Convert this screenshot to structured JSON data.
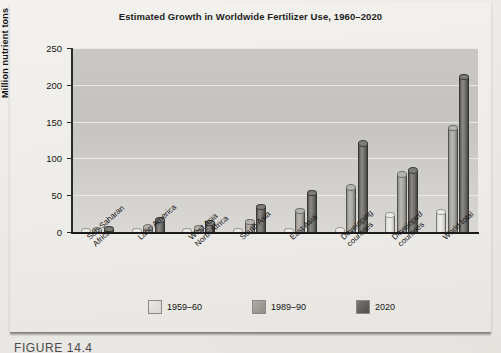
{
  "figure": {
    "caption": "FIGURE 14.4"
  },
  "chart_data": {
    "type": "bar",
    "title": "Estimated Growth in Worldwide Fertilizer Use, 1960–2020",
    "xlabel": "",
    "ylabel": "Million nutrient tons",
    "ylim": [
      0,
      250
    ],
    "yticks": [
      0,
      50,
      100,
      150,
      200,
      250
    ],
    "ytick_labels": [
      "0",
      "50",
      "100",
      "150",
      "200",
      "250"
    ],
    "grid": "horizontal",
    "legend_position": "bottom",
    "categories": [
      "Sub-Saharan\nAfrica",
      "Latin America",
      "West Asia\nNorth Africa",
      "South Asia",
      "East Asia",
      "Developing\ncountries",
      "Developed\ncountries",
      "World total"
    ],
    "series": [
      {
        "name": "1959–60",
        "color": "#e3e2dd",
        "values": [
          3,
          2,
          1,
          2,
          2,
          4,
          25,
          29
        ]
      },
      {
        "name": "1989–90",
        "color": "#a6a5a0",
        "values": [
          4,
          8,
          7,
          15,
          30,
          62,
          80,
          143
        ]
      },
      {
        "name": "2020",
        "color": "#5c5b57",
        "values": [
          6,
          18,
          14,
          36,
          55,
          122,
          85,
          212
        ]
      }
    ]
  }
}
